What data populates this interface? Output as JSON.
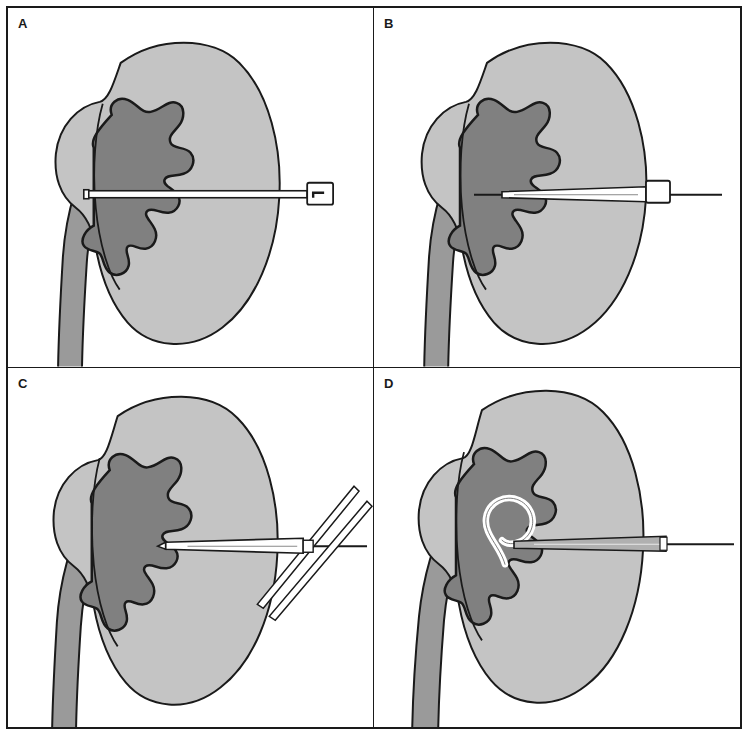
{
  "figure": {
    "panel_count": 4,
    "layout": "2x2 grid",
    "background_color": "#ffffff",
    "border_color": "#1a1a1a"
  },
  "palette": {
    "renal_parenchyma": "#c4c4c4",
    "collecting_system": "#808080",
    "ureter": "#9a9a9a",
    "outline": "#1a1a1a",
    "instrument_fill": "#ffffff",
    "instrument_outline": "#1a1a1a",
    "catheter_shaft": "#b0b0b0",
    "guidewire": "#1a1a1a",
    "label_color": "#1a1a1a"
  },
  "panels": [
    {
      "id": "panel-a",
      "label": "A",
      "caption": "Needle puncture into the renal collecting system",
      "instrument": "puncture-needle",
      "instrument_label": "Needle with hub",
      "has_guidewire": false,
      "has_dilators": false,
      "has_pigtail_coil": false
    },
    {
      "id": "panel-b",
      "label": "B",
      "caption": "Guidewire advanced through the needle into the collecting system",
      "instrument": "guidewire-through-sheath",
      "instrument_label": "Guidewire and sheath",
      "has_guidewire": true,
      "has_dilators": false,
      "has_pigtail_coil": false
    },
    {
      "id": "panel-c",
      "label": "C",
      "caption": "Serial fascial dilators passed over the guidewire",
      "instrument": "serial-dilators",
      "instrument_label": "Dilators over guidewire",
      "has_guidewire": true,
      "has_dilators": true,
      "has_pigtail_coil": false
    },
    {
      "id": "panel-d",
      "label": "D",
      "caption": "Pigtail nephrostomy catheter coiled within the renal pelvis",
      "instrument": "pigtail-nephrostomy-catheter",
      "instrument_label": "Pigtail catheter",
      "has_guidewire": true,
      "has_dilators": false,
      "has_pigtail_coil": true
    }
  ],
  "anatomy": {
    "parts": [
      {
        "name": "renal-cortex",
        "label": "Renal parenchyma",
        "color": "#c4c4c4"
      },
      {
        "name": "collecting-system",
        "label": "Calyces and renal pelvis",
        "color": "#808080"
      },
      {
        "name": "ureter",
        "label": "Ureter",
        "color": "#9a9a9a"
      },
      {
        "name": "renal-vessel",
        "label": "Renal vessel",
        "color": "#1a1a1a"
      }
    ]
  }
}
